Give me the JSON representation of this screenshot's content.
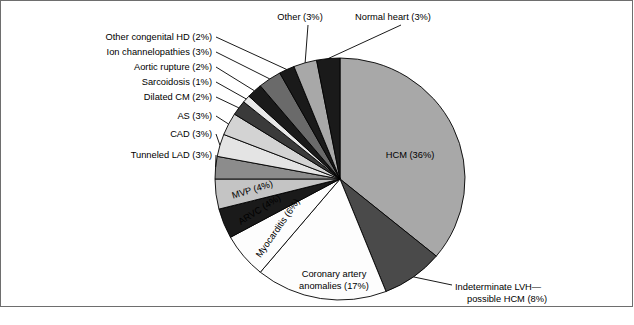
{
  "figure": {
    "title": "",
    "background_color": "#ffffff",
    "frame_border_color": "#6e6e6e",
    "footer": {
      "dark_block_color": "#2f2f2f",
      "light_bar_color": "#d9d9d9"
    }
  },
  "chart_data": {
    "type": "pie",
    "title": "",
    "xlabel": "",
    "ylabel": "",
    "legend_position": "none",
    "grid": false,
    "start_angle_deg": 0,
    "direction": "clockwise",
    "center": {
      "x": 340,
      "y": 179
    },
    "radius": {
      "x": 125,
      "y": 121
    },
    "total_percent": 100,
    "categories": [
      "HCM",
      "Indeterminate LVH—possible HCM",
      "Coronary artery anomalies",
      "Myocarditis",
      "ARVC",
      "MVP",
      "Tunneled LAD",
      "CAD",
      "AS",
      "Dilated CM",
      "Sarcoidosis",
      "Aortic rupture",
      "Ion channelopathies",
      "Other congenital HD",
      "Other",
      "Normal heart"
    ],
    "values": [
      36,
      8,
      17,
      6,
      4,
      4,
      3,
      3,
      3,
      2,
      1,
      2,
      3,
      2,
      3,
      3
    ],
    "colors": [
      "#a8a8a8",
      "#4a4a4a",
      "#fdfdfd",
      "#fdfdfd",
      "#1a1a1a",
      "#c4c4c4",
      "#8c8c8c",
      "#e4e4e4",
      "#d3d3d3",
      "#3a3a3a",
      "#e8e8e8",
      "#1a1a1a",
      "#6a6a6a",
      "#1a1a1a",
      "#a8a8a8",
      "#1a1a1a"
    ],
    "slices": [
      {
        "label": "HCM (36%)",
        "name": "HCM",
        "value": 36,
        "color": "#a8a8a8",
        "label_placement": "inside"
      },
      {
        "label_line1": "Indeterminate LVH—",
        "label_line2": "possible HCM (8%)",
        "name": "Indeterminate LVH—possible HCM",
        "value": 8,
        "color": "#4a4a4a",
        "label_placement": "callout-right"
      },
      {
        "label_line1": "Coronary artery",
        "label_line2": "anomalies (17%)",
        "name": "Coronary artery anomalies",
        "value": 17,
        "color": "#fdfdfd",
        "label_placement": "inside"
      },
      {
        "label": "Myocarditis (6%)",
        "name": "Myocarditis",
        "value": 6,
        "color": "#fdfdfd",
        "label_placement": "inside-rotated"
      },
      {
        "label": "ARVC (4%)",
        "name": "ARVC",
        "value": 4,
        "color": "#1a1a1a",
        "label_placement": "inside-rotated"
      },
      {
        "label": "MVP (4%)",
        "name": "MVP",
        "value": 4,
        "color": "#c4c4c4",
        "label_placement": "inside-rotated"
      },
      {
        "label": "Tunneled LAD (3%)",
        "name": "Tunneled LAD",
        "value": 3,
        "color": "#8c8c8c",
        "label_placement": "callout-left"
      },
      {
        "label": "CAD (3%)",
        "name": "CAD",
        "value": 3,
        "color": "#e4e4e4",
        "label_placement": "callout-left"
      },
      {
        "label": "AS (3%)",
        "name": "AS",
        "value": 3,
        "color": "#d3d3d3",
        "label_placement": "callout-left"
      },
      {
        "label": "Dilated CM (2%)",
        "name": "Dilated CM",
        "value": 2,
        "color": "#3a3a3a",
        "label_placement": "callout-left"
      },
      {
        "label": "Sarcoidosis (1%)",
        "name": "Sarcoidosis",
        "value": 1,
        "color": "#e8e8e8",
        "label_placement": "callout-left"
      },
      {
        "label": "Aortic rupture (2%)",
        "name": "Aortic rupture",
        "value": 2,
        "color": "#1a1a1a",
        "label_placement": "callout-left"
      },
      {
        "label": "Ion channelopathies (3%)",
        "name": "Ion channelopathies",
        "value": 3,
        "color": "#6a6a6a",
        "label_placement": "callout-left"
      },
      {
        "label": "Other congenital HD (2%)",
        "name": "Other congenital HD",
        "value": 2,
        "color": "#1a1a1a",
        "label_placement": "callout-left"
      },
      {
        "label": "Other (3%)",
        "name": "Other",
        "value": 3,
        "color": "#a8a8a8",
        "label_placement": "callout-top"
      },
      {
        "label": "Normal heart (3%)",
        "name": "Normal heart",
        "value": 3,
        "color": "#1a1a1a",
        "label_placement": "callout-top"
      }
    ]
  }
}
